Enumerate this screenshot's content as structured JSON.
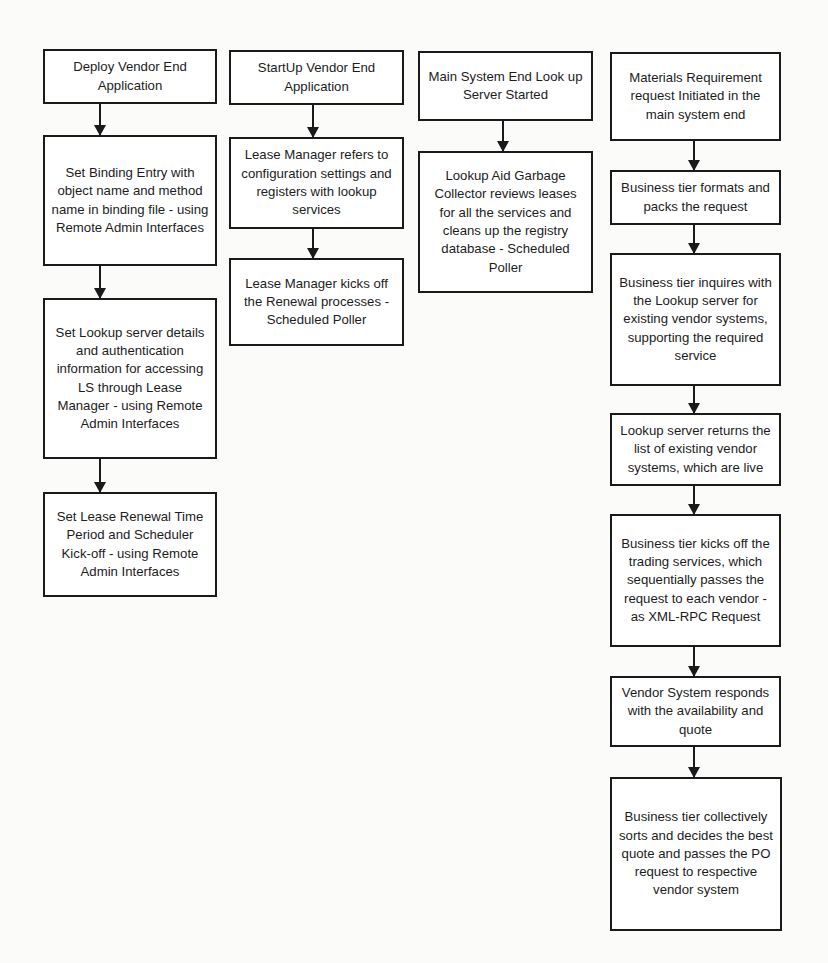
{
  "diagram": {
    "type": "flowchart",
    "columns": [
      {
        "id": "vendor-deploy",
        "steps": [
          "Deploy Vendor End Application",
          "Set Binding Entry with object name and method name in binding file - using Remote Admin Interfaces",
          "Set Lookup server details and authentication information for accessing LS through Lease Manager - using Remote Admin Interfaces",
          "Set Lease Renewal Time Period and Scheduler Kick-off - using Remote Admin Interfaces"
        ]
      },
      {
        "id": "vendor-startup",
        "steps": [
          "StartUp Vendor End Application",
          "Lease Manager refers to configuration settings and registers with lookup services",
          "Lease Manager kicks off the Renewal processes - Scheduled Poller"
        ]
      },
      {
        "id": "main-lookup",
        "steps": [
          "Main System End Look up Server Started",
          "Lookup Aid Garbage Collector reviews leases for all the services and cleans up the registry database - Scheduled Poller"
        ]
      },
      {
        "id": "materials-request",
        "steps": [
          "Materials Requirement request Initiated in the main system end",
          "Business tier formats and packs the request",
          "Business tier inquires with the Lookup server for existing vendor systems, supporting the required service",
          "Lookup server returns the list of existing vendor systems, which are live",
          "Business tier kicks off the trading services, which sequentially passes the request to each vendor - as XML-RPC Request",
          "Vendor System responds with the availability and quote",
          "Business tier collectively sorts and decides the best quote and passes the PO request to respective vendor system"
        ]
      }
    ],
    "colors": {
      "border": "#1a1a1a",
      "box_fill": "#ffffff",
      "background": "#fbfbfa",
      "text": "#1c1c1c"
    }
  }
}
